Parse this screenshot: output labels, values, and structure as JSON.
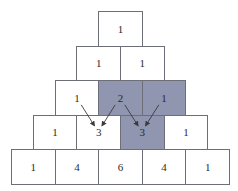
{
  "colors": {
    "shaded": "#9095b0",
    "border": "#6d6f78",
    "arrow": "#3a3a3a"
  },
  "rows": [
    {
      "cells": [
        {
          "value": "1",
          "shaded": false
        }
      ]
    },
    {
      "cells": [
        {
          "value": "1",
          "shaded": false
        },
        {
          "value": "1",
          "shaded": false
        }
      ]
    },
    {
      "cells": [
        {
          "value": "1",
          "shaded": false
        },
        {
          "value": "2",
          "shaded": true
        },
        {
          "value": "1",
          "shaded": true
        }
      ]
    },
    {
      "cells": [
        {
          "value": "1",
          "shaded": false
        },
        {
          "value": "3",
          "shaded": false
        },
        {
          "value": "3",
          "shaded": true
        },
        {
          "value": "1",
          "shaded": false
        }
      ]
    },
    {
      "cells": [
        {
          "value": "1",
          "shaded": false
        },
        {
          "value": "4",
          "shaded": false
        },
        {
          "value": "6",
          "shaded": false
        },
        {
          "value": "4",
          "shaded": false
        },
        {
          "value": "1",
          "shaded": false
        }
      ]
    }
  ],
  "arrows": [
    {
      "from": [
        2,
        0
      ],
      "to": [
        3,
        1
      ]
    },
    {
      "from": [
        2,
        1
      ],
      "to": [
        3,
        1
      ]
    },
    {
      "from": [
        2,
        1
      ],
      "to": [
        3,
        2
      ]
    },
    {
      "from": [
        2,
        2
      ],
      "to": [
        3,
        2
      ]
    }
  ]
}
